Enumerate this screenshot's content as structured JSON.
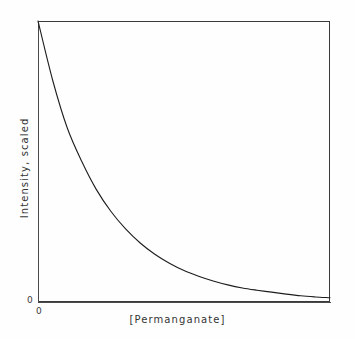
{
  "figure": {
    "background_color": "#fefefe",
    "line_color": "#1d1d1d",
    "axis_color": "#4a4a4a"
  },
  "axes": {
    "x_title": "[Permanganate]",
    "y_title": "Intensity, scaled",
    "x_origin_label": "0",
    "y_origin_label": "0"
  },
  "chart_data": {
    "type": "line",
    "title": "",
    "xlabel": "[Permanganate]",
    "ylabel": "Intensity, scaled",
    "xlim": [
      0,
      1
    ],
    "ylim": [
      0,
      1
    ],
    "grid": false,
    "legend": false,
    "x_tick_labels": [
      "0"
    ],
    "y_tick_labels": [
      "0"
    ],
    "series": [
      {
        "name": "Intensity, scaled",
        "x": [
          0.0,
          0.05,
          0.1,
          0.15,
          0.2,
          0.25,
          0.3,
          0.35,
          0.4,
          0.45,
          0.5,
          0.55,
          0.6,
          0.65,
          0.7,
          0.75,
          0.8,
          0.85,
          0.9,
          0.95,
          1.0
        ],
        "values": [
          1.0,
          0.79,
          0.62,
          0.5,
          0.4,
          0.322,
          0.26,
          0.21,
          0.17,
          0.138,
          0.112,
          0.092,
          0.075,
          0.061,
          0.05,
          0.042,
          0.035,
          0.028,
          0.022,
          0.018,
          0.015
        ]
      }
    ]
  }
}
